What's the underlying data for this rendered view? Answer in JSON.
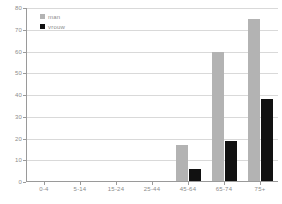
{
  "chart_data": {
    "type": "bar",
    "title": "",
    "subtitle": "",
    "xlabel": "",
    "ylabel": "",
    "categories": [
      "0-4",
      "5-14",
      "15-24",
      "25-44",
      "45-64",
      "65-74",
      "75+"
    ],
    "series": [
      {
        "name": "man",
        "color": "#b3b3b3",
        "values": [
          0,
          0,
          0,
          0.5,
          17,
          60,
          75
        ]
      },
      {
        "name": "vrouw",
        "color": "#111111",
        "values": [
          0,
          0,
          0,
          0.4,
          6,
          19,
          38
        ]
      }
    ],
    "ylim": [
      0,
      80
    ],
    "yticks": [
      0,
      10,
      20,
      30,
      40,
      50,
      60,
      70,
      80
    ],
    "ytick_labels": [
      "0",
      "10",
      "20",
      "30",
      "40",
      "50",
      "60",
      "70",
      "80"
    ],
    "grid": true,
    "legend_position": "top-left",
    "legend": [
      {
        "label": "man",
        "color": "#b3b3b3",
        "swatch": "legend-swatch-man"
      },
      {
        "label": "vrouw",
        "color": "#111111",
        "swatch": "legend-swatch-vrouw"
      }
    ],
    "annotations": []
  },
  "colors": {
    "background": "#ffffff",
    "grid": "#d9d9d9",
    "axis": "#9a9a9a",
    "tick_text": "#8c8c8c",
    "series_man": "#b3b3b3",
    "series_vrouw": "#111111"
  }
}
